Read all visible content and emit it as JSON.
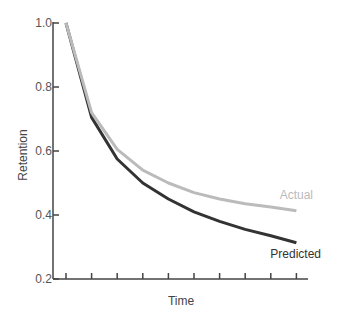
{
  "chart_data": {
    "type": "line",
    "title": "",
    "xlabel": "Time",
    "ylabel": "Retention",
    "ylim": [
      0.2,
      1.0
    ],
    "yticks": [
      "1.0",
      "0.8",
      "0.6",
      "0.4",
      "0.2"
    ],
    "ytick_values": [
      1.0,
      0.8,
      0.6,
      0.4,
      0.2
    ],
    "x": [
      1,
      2,
      3,
      4,
      5,
      6,
      7,
      8,
      9,
      10
    ],
    "xtick_count": 10,
    "xtick_labels": [],
    "grid": false,
    "legend": "inline labels at line ends",
    "series": [
      {
        "name": "Actual",
        "color": "#bbbbbb",
        "values": [
          1.0,
          0.72,
          0.605,
          0.54,
          0.5,
          0.47,
          0.45,
          0.435,
          0.425,
          0.413
        ]
      },
      {
        "name": "Predicted",
        "color": "#333333",
        "values": [
          1.0,
          0.705,
          0.575,
          0.5,
          0.45,
          0.41,
          0.38,
          0.355,
          0.335,
          0.313
        ]
      }
    ]
  },
  "colors": {
    "axis": "#444444",
    "tick_label": "#555555",
    "actual": "#bbbbbb",
    "predicted": "#333333"
  }
}
